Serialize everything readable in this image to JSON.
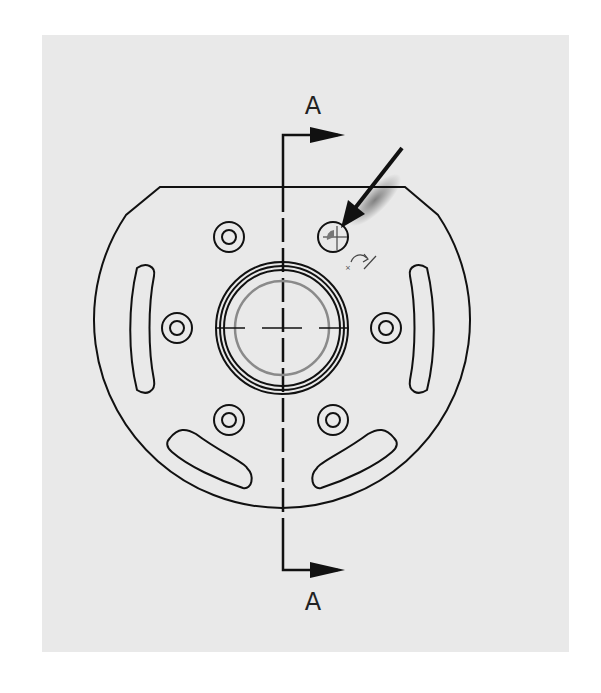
{
  "drawing": {
    "type": "engineering section view marker",
    "section_label_top": "A",
    "section_label_bottom": "A",
    "colors": {
      "background": "#e9e9e9",
      "line": "#111111",
      "hidden_circle": "#808080"
    },
    "part": {
      "outline": "circular flange with flat top edge",
      "center": [
        282,
        328
      ],
      "radius": 188,
      "flat_top_y": 187,
      "bore_rings": [
        66,
        61,
        57
      ],
      "inner_gray_circle_radius": 47,
      "holes": [
        {
          "x": 229,
          "y": 237,
          "selected": false
        },
        {
          "x": 333,
          "y": 237,
          "selected": true
        },
        {
          "x": 177,
          "y": 328,
          "selected": false
        },
        {
          "x": 386,
          "y": 328,
          "selected": false
        },
        {
          "x": 229,
          "y": 420,
          "selected": false
        },
        {
          "x": 333,
          "y": 420,
          "selected": false
        }
      ],
      "slots": [
        "left-vertical",
        "right-vertical",
        "lower-left-arc",
        "lower-right-arc"
      ]
    },
    "cursor": {
      "type": "pointer-arrow-with-rotate-hint",
      "target": "upper-right hole"
    }
  }
}
